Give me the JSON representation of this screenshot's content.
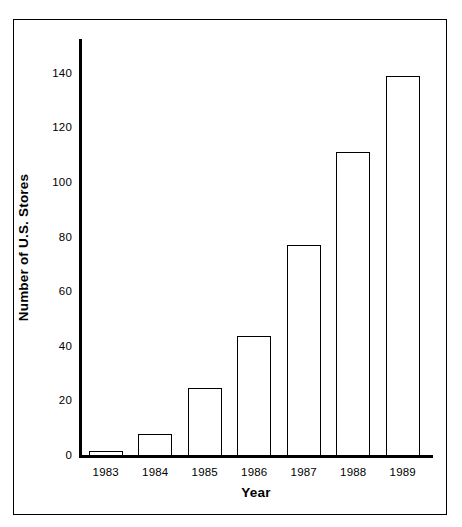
{
  "chart_data": {
    "type": "bar",
    "title": "",
    "subtitle": "",
    "xlabel": "Year",
    "ylabel": "Number of U.S. Stores",
    "categories": [
      "1983",
      "1984",
      "1985",
      "1986",
      "1987",
      "1988",
      "1989"
    ],
    "values": [
      2,
      8,
      25,
      44,
      77,
      111,
      139
    ],
    "series": [
      {
        "name": "Number of U.S. Stores",
        "values": [
          2,
          8,
          25,
          44,
          77,
          111,
          139
        ]
      }
    ],
    "ylim": [
      0,
      140
    ],
    "xlim": null,
    "y_ticks": [
      0,
      20,
      40,
      60,
      80,
      100,
      120,
      140
    ],
    "y_tick_labels": [
      "0",
      "20",
      "40",
      "60",
      "80",
      "100",
      "120",
      "140"
    ],
    "x_tick_labels": [
      "1983",
      "1984",
      "1985",
      "1986",
      "1987",
      "1988",
      "1989"
    ],
    "grid": false,
    "legend": null,
    "legend_position": "none",
    "annotations": [],
    "colors": {
      "bar_fill": "#ffffff",
      "bar_stroke": "#000000",
      "axis": "#000000",
      "text": "#000000",
      "frame": "#000000",
      "background": "#ffffff"
    }
  },
  "figure": {
    "frame_visible": true,
    "background_color": "#ffffff"
  }
}
